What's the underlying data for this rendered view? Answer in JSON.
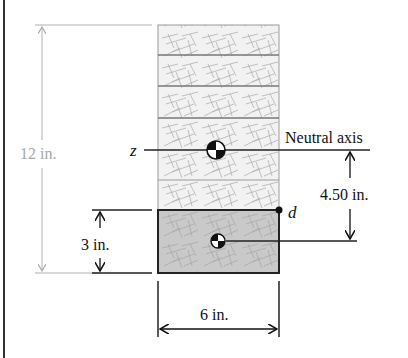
{
  "diagram": {
    "labels": {
      "overall_height": "12 in.",
      "neutral_axis": "Neutral axis",
      "axis_z": "z",
      "point_d": "d",
      "na_to_centroid": "4.50 in.",
      "bottom_board_height": "3 in.",
      "width": "6 in."
    },
    "colors": {
      "light_fill": "#f0f0f0",
      "dark_fill": "#c8c8c8",
      "grain": "#9a9a9a",
      "outline": "#222222",
      "dimension_gray": "#b0b0b0"
    },
    "boards": [
      {
        "name": "board-1",
        "top": 25,
        "bottom": 55,
        "shaded": false
      },
      {
        "name": "board-2",
        "top": 55,
        "bottom": 86,
        "shaded": false
      },
      {
        "name": "board-3",
        "top": 86,
        "bottom": 118,
        "shaded": false
      },
      {
        "name": "board-4",
        "top": 118,
        "bottom": 180,
        "shaded": false
      },
      {
        "name": "board-5",
        "top": 180,
        "bottom": 210,
        "shaded": false
      },
      {
        "name": "board-6",
        "top": 210,
        "bottom": 273,
        "shaded": true
      }
    ]
  }
}
